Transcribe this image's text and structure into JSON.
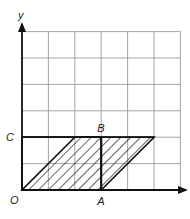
{
  "diagram": {
    "type": "coordinate-grid-geometry",
    "axes": {
      "x_label": "",
      "y_label": "y"
    },
    "grid": {
      "columns": 6,
      "rows": 6
    },
    "points": [
      {
        "name": "O",
        "label": "O",
        "x": 0,
        "y": 0
      },
      {
        "name": "A",
        "label": "A",
        "x": 3,
        "y": 0
      },
      {
        "name": "B",
        "label": "B",
        "x": 3,
        "y": 2
      },
      {
        "name": "C",
        "label": "C",
        "x": 0,
        "y": 2
      }
    ],
    "rectangle": {
      "vertices": [
        "O",
        "A",
        "B",
        "C"
      ]
    },
    "parallelogram": {
      "vertices": [
        [
          0,
          0
        ],
        [
          3,
          0
        ],
        [
          5,
          2
        ],
        [
          2,
          2
        ]
      ],
      "shading": "hatched"
    },
    "colors": {
      "grid": "#9a9a9a",
      "lines": "#111111",
      "background": "#ffffff"
    }
  }
}
